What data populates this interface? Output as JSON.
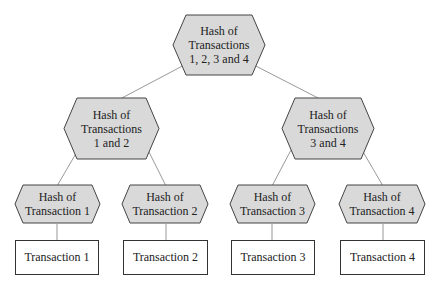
{
  "diagram": {
    "type": "merkle-tree",
    "colors": {
      "hash_fill": "#d9d9d9",
      "hash_stroke": "#444444",
      "line": "#999999",
      "box_stroke": "#333333"
    },
    "root": {
      "line1": "Hash of",
      "line2": "Transactions",
      "line3": "1, 2, 3 and 4"
    },
    "mid": [
      {
        "line1": "Hash of",
        "line2": "Transactions",
        "line3": "1 and 2"
      },
      {
        "line1": "Hash of",
        "line2": "Transactions",
        "line3": "3 and 4"
      }
    ],
    "leaf_hashes": [
      {
        "line1": "Hash of",
        "line2": "Transaction 1"
      },
      {
        "line1": "Hash of",
        "line2": "Transaction 2"
      },
      {
        "line1": "Hash of",
        "line2": "Transaction 3"
      },
      {
        "line1": "Hash of",
        "line2": "Transaction 4"
      }
    ],
    "transactions": [
      "Transaction 1",
      "Transaction 2",
      "Transaction 3",
      "Transaction 4"
    ]
  }
}
